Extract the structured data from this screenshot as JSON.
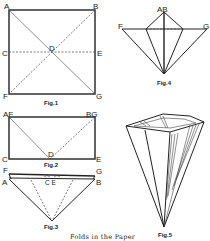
{
  "caption": "Folds in the Paper",
  "figures": [
    {
      "id": "fig1",
      "label": "Fig.1",
      "points": [
        "A",
        "B",
        "C",
        "D",
        "E",
        "F",
        "G"
      ]
    },
    {
      "id": "fig2",
      "label": "Fig.2",
      "points": [
        "AF",
        "BG",
        "C",
        "D",
        "E"
      ]
    },
    {
      "id": "fig3",
      "label": "Fig.3",
      "points": [
        "F",
        "G",
        "A",
        "B",
        "C",
        "E"
      ]
    },
    {
      "id": "fig4",
      "label": "Fig.4",
      "points": [
        "AB",
        "F",
        "G"
      ]
    },
    {
      "id": "fig5",
      "label": "Fig.5",
      "points": []
    }
  ],
  "labels": {
    "fig1": {
      "A": "A",
      "B": "B",
      "C": "C",
      "D": "D",
      "E": "E",
      "F": "F",
      "G": "G",
      "title": "Fig.1"
    },
    "fig2": {
      "AF": "AF",
      "BG": "BG",
      "C": "C",
      "D": "D",
      "E": "E",
      "title": "Fig.2"
    },
    "fig3": {
      "F": "F",
      "G": "G",
      "A": "A",
      "B": "B",
      "CE": "C E",
      "title": "Fig.3"
    },
    "fig4": {
      "AB": "AB",
      "F": "F",
      "G": "G",
      "title": "Fig.4"
    },
    "fig5": {
      "title": "Fig.5"
    }
  }
}
